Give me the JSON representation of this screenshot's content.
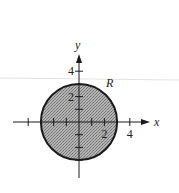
{
  "diagram": {
    "type": "region-disk",
    "region_label": "R",
    "radius": 3,
    "center": [
      0,
      0
    ],
    "axes": {
      "x_label": "x",
      "y_label": "y",
      "x_tick_labels": [
        {
          "value": 2,
          "text": "2"
        },
        {
          "value": 4,
          "text": "4"
        }
      ],
      "y_tick_labels": [
        {
          "value": 2,
          "text": "2"
        },
        {
          "value": 4,
          "text": "4"
        }
      ],
      "x_ticks": [
        -4,
        -2,
        -1,
        1,
        2,
        4
      ],
      "y_ticks": [
        -3,
        -2,
        -1,
        1,
        2,
        4
      ],
      "x_range": [
        -5,
        6
      ],
      "y_range": [
        -4,
        5.5
      ]
    },
    "colors": {
      "fill": "#9a9a9a",
      "stroke": "#1a1a1a",
      "axis": "#1a1a1a"
    }
  }
}
